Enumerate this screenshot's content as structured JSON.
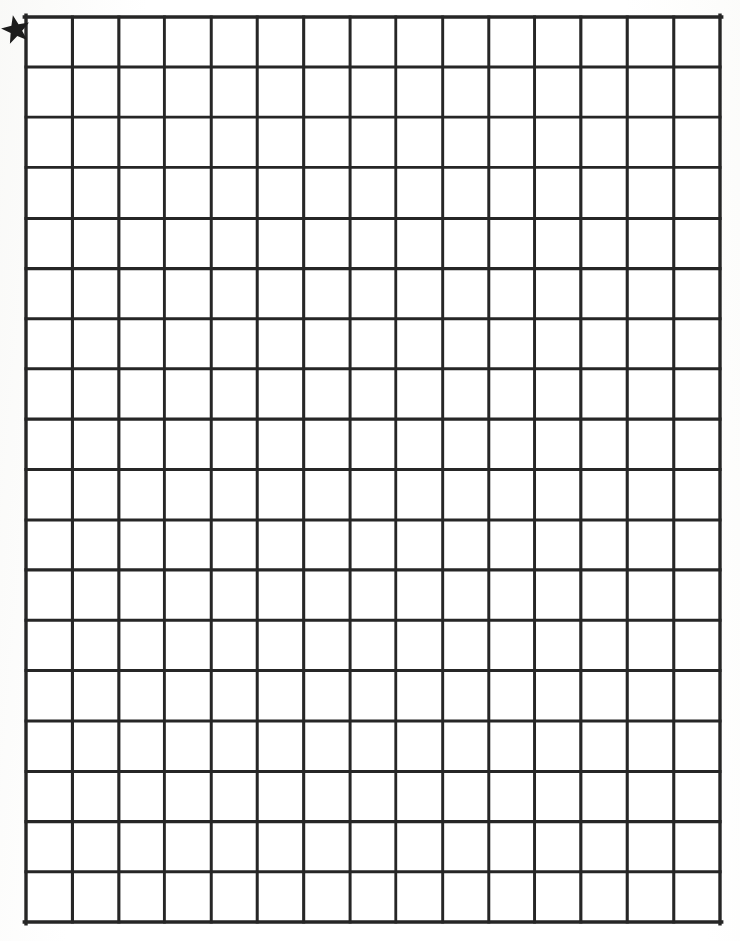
{
  "page": {
    "background_color": "#ffffff",
    "paper_tone": "#fefefe",
    "width": 740,
    "height": 941
  },
  "grid": {
    "name": "blank-square-grid",
    "columns": 15,
    "rows": 18,
    "left": 26,
    "top": 17,
    "right": 720,
    "bottom": 922,
    "cell_width": 46.3,
    "cell_height": 50.3,
    "line_color": "#262626",
    "line_width": 3.0,
    "outer_line_width": 3.4,
    "fill_color": "#ffffff",
    "cell_label": ""
  },
  "marker": {
    "name": "star-marker",
    "shape": "five-pointed-star",
    "color": "#1c1c1c",
    "center_x": 16,
    "center_y": 30,
    "outer_radius": 15,
    "inner_radius": 6.2,
    "rotation_degrees": -12,
    "label": "",
    "description": "Black five-pointed star at the upper-left outside corner of the grid"
  },
  "chart_data": {
    "type": "table",
    "xlabel": "",
    "ylabel": "",
    "columns": 15,
    "rows": 18,
    "grid": true,
    "legend": "none",
    "values": [],
    "annotations": [
      {
        "type": "star",
        "text": "",
        "position": "top-left-outside",
        "x": 16,
        "y": 30
      }
    ]
  }
}
